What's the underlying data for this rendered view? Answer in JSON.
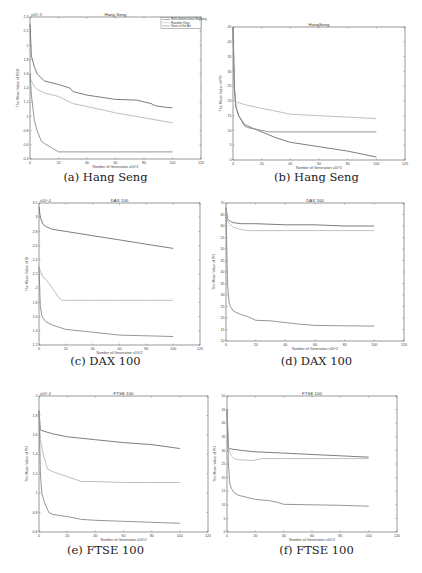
{
  "figure": {
    "panels": [
      {
        "id": "a",
        "caption": "(a) Hang Seng"
      },
      {
        "id": "b",
        "caption": "(b) Hang Seng"
      },
      {
        "id": "c",
        "caption": "(c) DAX 100"
      },
      {
        "id": "d",
        "caption": "(d) DAX 100"
      },
      {
        "id": "e",
        "caption": "(e) FTSE 100"
      },
      {
        "id": "f",
        "caption": "(f) FTSE 100"
      }
    ]
  },
  "legend": [
    "Multi-dimensional Mapping",
    "Random Keys",
    "State of the Art"
  ],
  "colors": {
    "series_dark": "#6e6e6e",
    "series_mid": "#8a8a8a",
    "series_light": "#b8b8b8",
    "axes": "#555555"
  },
  "chart_data": [
    {
      "id": "a",
      "type": "line",
      "title": "Hang Seng",
      "xlabel": "Number of Generation x10^2",
      "ylabel": "The Mean Value of SSD",
      "y_multiplier": "x10^-3",
      "xlim": [
        0,
        120
      ],
      "ylim": [
        0.4,
        2.4
      ],
      "xticks": [
        0,
        20,
        40,
        60,
        80,
        100,
        120
      ],
      "yticks": [
        0.4,
        0.6,
        0.8,
        1,
        1.2,
        1.4,
        1.6,
        1.8,
        2,
        2.2,
        2.4
      ],
      "legend_position": "upper right",
      "series": [
        {
          "name": "Multi-dimensional Mapping",
          "x": [
            0,
            1,
            3,
            5,
            10,
            20,
            28,
            30,
            40,
            60,
            75,
            85,
            88,
            95,
            100
          ],
          "values": [
            2.3,
            1.85,
            1.7,
            1.6,
            1.5,
            1.45,
            1.4,
            1.35,
            1.3,
            1.24,
            1.23,
            1.18,
            1.15,
            1.13,
            1.12
          ]
        },
        {
          "name": "Random Keys",
          "x": [
            0,
            1,
            3,
            5,
            10,
            20,
            30,
            40,
            60,
            80,
            100
          ],
          "values": [
            1.55,
            1.5,
            1.42,
            1.38,
            1.33,
            1.28,
            1.18,
            1.14,
            1.05,
            0.98,
            0.91
          ]
        },
        {
          "name": "State of the Art",
          "x": [
            0,
            1,
            3,
            5,
            8,
            10,
            15,
            20,
            40,
            60,
            80,
            100
          ],
          "values": [
            1.6,
            1.3,
            0.95,
            0.8,
            0.65,
            0.62,
            0.56,
            0.5,
            0.5,
            0.5,
            0.5,
            0.5
          ]
        }
      ]
    },
    {
      "id": "b",
      "type": "line",
      "title": "HangSeng",
      "xlabel": "Number of Generation x10^2",
      "ylabel": "The Mean Value of PD",
      "xlim": [
        0,
        120
      ],
      "ylim": [
        0,
        45
      ],
      "xticks": [
        0,
        20,
        40,
        60,
        80,
        100,
        120
      ],
      "yticks": [
        0,
        5,
        10,
        15,
        20,
        25,
        30,
        35,
        40,
        45
      ],
      "series": [
        {
          "name": "Multi-dimensional Mapping",
          "x": [
            0,
            1,
            2,
            4,
            8,
            15,
            20,
            30,
            40,
            60,
            80,
            100
          ],
          "values": [
            45,
            25,
            18,
            15,
            12,
            10.5,
            9.5,
            7.5,
            6,
            4.5,
            3,
            1
          ]
        },
        {
          "name": "Random Keys",
          "x": [
            0,
            1,
            3,
            10,
            20,
            30,
            40,
            60,
            80,
            100
          ],
          "values": [
            20.5,
            20,
            19.5,
            18.5,
            17.5,
            16.5,
            15.5,
            15,
            14.5,
            14
          ]
        },
        {
          "name": "State of the Art",
          "x": [
            0,
            1,
            2,
            4,
            8,
            10,
            20,
            25,
            40,
            60,
            80,
            100
          ],
          "values": [
            45,
            24,
            18,
            15,
            11.5,
            11,
            10,
            9.5,
            9.5,
            9.5,
            9.5,
            9.5
          ]
        }
      ]
    },
    {
      "id": "c",
      "type": "line",
      "title": "DAX 100",
      "xlabel": "Number of Generation x10^2",
      "ylabel": "The Mean Value of ID",
      "y_multiplier": "x10^-4",
      "xlim": [
        0,
        120
      ],
      "ylim": [
        1.2,
        3.2
      ],
      "xticks": [
        0,
        20,
        40,
        60,
        80,
        100,
        120
      ],
      "yticks": [
        1.2,
        1.4,
        1.6,
        1.8,
        2,
        2.2,
        2.4,
        2.6,
        2.8,
        3,
        3.2
      ],
      "series": [
        {
          "name": "Multi-dimensional Mapping",
          "x": [
            0,
            1,
            3,
            5,
            10,
            20,
            40,
            60,
            80,
            100
          ],
          "values": [
            3.15,
            3.0,
            2.9,
            2.87,
            2.83,
            2.8,
            2.74,
            2.68,
            2.62,
            2.56
          ]
        },
        {
          "name": "Random Keys",
          "x": [
            0,
            1,
            2,
            3,
            5,
            10,
            15,
            17,
            20,
            40,
            60,
            80,
            100
          ],
          "values": [
            2.3,
            2.25,
            2.2,
            2.15,
            2.13,
            2.0,
            1.86,
            1.83,
            1.83,
            1.83,
            1.83,
            1.83,
            1.83
          ]
        },
        {
          "name": "State of the Art",
          "x": [
            0,
            1,
            2,
            3,
            5,
            10,
            20,
            40,
            60,
            80,
            100
          ],
          "values": [
            2.3,
            1.75,
            1.62,
            1.58,
            1.53,
            1.48,
            1.42,
            1.38,
            1.34,
            1.33,
            1.32
          ]
        }
      ]
    },
    {
      "id": "d",
      "type": "line",
      "title": "DAX 100",
      "xlabel": "Number of Generation x10^2",
      "ylabel": "The Mean Value of PD",
      "xlim": [
        0,
        120
      ],
      "ylim": [
        10,
        70
      ],
      "xticks": [
        0,
        20,
        40,
        60,
        80,
        100,
        120
      ],
      "yticks": [
        10,
        15,
        20,
        25,
        30,
        35,
        40,
        45,
        50,
        55,
        60,
        65,
        70
      ],
      "series": [
        {
          "name": "Multi-dimensional Mapping",
          "x": [
            0,
            1,
            3,
            5,
            10,
            20,
            40,
            60,
            80,
            100
          ],
          "values": [
            68,
            63,
            62,
            61.5,
            61,
            61,
            60.5,
            60.5,
            60,
            60
          ]
        },
        {
          "name": "Random Keys",
          "x": [
            0,
            1,
            3,
            5,
            10,
            15,
            20,
            40,
            60,
            80,
            100
          ],
          "values": [
            68,
            62,
            60.5,
            59.5,
            58.5,
            58,
            58,
            58,
            58,
            58,
            58
          ]
        },
        {
          "name": "State of the Art",
          "x": [
            0,
            1,
            2,
            3,
            5,
            10,
            15,
            20,
            30,
            40,
            50,
            60,
            80,
            100
          ],
          "values": [
            68,
            35,
            27,
            25,
            23,
            21.5,
            20.5,
            19,
            18.8,
            18,
            17.3,
            16.8,
            16.6,
            16.5
          ]
        }
      ]
    },
    {
      "id": "e",
      "type": "line",
      "title": "FTSE 100",
      "xlabel": "Number of Generation x10^2",
      "ylabel": "The Mean Value of PD",
      "y_multiplier": "x10^-4",
      "xlim": [
        0,
        120
      ],
      "ylim": [
        0.6,
        2.0
      ],
      "xticks": [
        0,
        20,
        40,
        60,
        80,
        100,
        120
      ],
      "yticks": [
        0.6,
        0.8,
        1,
        1.2,
        1.4,
        1.6,
        1.8,
        2
      ],
      "series": [
        {
          "name": "Multi-dimensional Mapping",
          "x": [
            0,
            1,
            5,
            10,
            20,
            40,
            60,
            80,
            100
          ],
          "values": [
            1.85,
            1.65,
            1.63,
            1.61,
            1.58,
            1.55,
            1.52,
            1.5,
            1.46
          ]
        },
        {
          "name": "Random Keys",
          "x": [
            0,
            1,
            3,
            6,
            10,
            20,
            30,
            40,
            60,
            80,
            100
          ],
          "values": [
            1.85,
            1.55,
            1.4,
            1.25,
            1.22,
            1.17,
            1.12,
            1.12,
            1.11,
            1.11,
            1.11
          ]
        },
        {
          "name": "State of the Art",
          "x": [
            0,
            1,
            2,
            4,
            7,
            10,
            20,
            30,
            40,
            60,
            80,
            100
          ],
          "values": [
            1.85,
            1.2,
            1.0,
            0.9,
            0.8,
            0.78,
            0.76,
            0.73,
            0.72,
            0.71,
            0.7,
            0.69
          ]
        }
      ]
    },
    {
      "id": "f",
      "type": "line",
      "title": "FTSE 100",
      "xlabel": "Number of Generation x10^2",
      "ylabel": "The Mean Value of PD",
      "xlim": [
        0,
        120
      ],
      "ylim": [
        0,
        50
      ],
      "xticks": [
        0,
        20,
        40,
        60,
        80,
        100,
        120
      ],
      "yticks": [
        0,
        5,
        10,
        15,
        20,
        25,
        30,
        35,
        40,
        45,
        50
      ],
      "series": [
        {
          "name": "Multi-dimensional Mapping",
          "x": [
            0,
            1,
            3,
            10,
            20,
            40,
            60,
            80,
            100
          ],
          "values": [
            45,
            31,
            30.5,
            30,
            29.5,
            29,
            28.5,
            28,
            27.5
          ]
        },
        {
          "name": "Random Keys",
          "x": [
            0,
            1,
            3,
            5,
            8,
            12,
            18,
            25,
            40,
            60,
            80,
            100
          ],
          "values": [
            45,
            31,
            28,
            27,
            26.5,
            26.5,
            26.3,
            27,
            27,
            27,
            27,
            27
          ]
        },
        {
          "name": "State of the Art",
          "x": [
            0,
            1,
            2,
            3,
            5,
            8,
            12,
            20,
            30,
            35,
            40,
            60,
            80,
            100
          ],
          "values": [
            45,
            25,
            18,
            16,
            14.5,
            13.5,
            13,
            12,
            11.5,
            11,
            10.2,
            10,
            9.8,
            9.5
          ]
        }
      ]
    }
  ]
}
